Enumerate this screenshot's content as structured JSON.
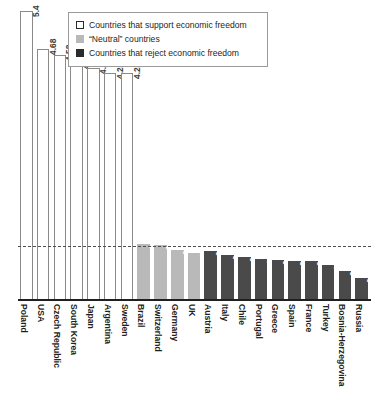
{
  "legend": {
    "position": "top-center",
    "entries": [
      {
        "key": "support",
        "label": "Countries that support economic freedom",
        "swatch": "white-square-icon",
        "color": "#ffffff"
      },
      {
        "key": "neutral",
        "label": "“Neutral” countries",
        "swatch": "gray-square-icon",
        "color": "#b9b9b9"
      },
      {
        "key": "reject",
        "label": "Countries that reject economic freedom",
        "swatch": "black-square-icon",
        "color": "#4a4a4a"
      }
    ]
  },
  "chart_data": {
    "type": "bar",
    "title": "",
    "subtitle": "",
    "xlabel": "",
    "ylabel": "",
    "ylim": [
      0,
      5.6
    ],
    "grid": false,
    "legend_position": "top-center",
    "reference_line": {
      "value": 1.0,
      "style": "dashed",
      "color": "#4d4d4d"
    },
    "group_colors": {
      "support": "#ffffff",
      "neutral": "#b9b9b9",
      "reject": "#4a4a4a"
    },
    "categories": [
      "Poland",
      "USA",
      "Czech Republic",
      "South Korea",
      "Japan",
      "Argentina",
      "Sweden",
      "Brazil",
      "Switzerland",
      "Germany",
      "UK",
      "Austria",
      "Italy",
      "Chile",
      "Portugal",
      "Greece",
      "Spain",
      "France",
      "Turkey",
      "Bosnia-Herzegovina",
      "Russia"
    ],
    "values": [
      5.4,
      4.68,
      4.58,
      4.42,
      4.33,
      4.24,
      4.24,
      1.04,
      1.02,
      0.94,
      0.88,
      0.92,
      0.84,
      0.8,
      0.76,
      0.75,
      0.73,
      0.72,
      0.65,
      0.54,
      0.42
    ],
    "value_labels": [
      "5.4",
      "4.68",
      "4.58",
      "4.42",
      "4.33",
      "4.24",
      "4.24",
      "1.04",
      "1.02",
      "0.94",
      "0.88",
      "0.92",
      "0.84",
      "0.8",
      "0.76",
      "0.75",
      "0.73",
      "0.72",
      "0.65",
      "0.54",
      "0.42"
    ],
    "groups": [
      "support",
      "support",
      "support",
      "support",
      "support",
      "support",
      "support",
      "neutral",
      "neutral",
      "neutral",
      "neutral",
      "reject",
      "reject",
      "reject",
      "reject",
      "reject",
      "reject",
      "reject",
      "reject",
      "reject",
      "reject"
    ]
  }
}
